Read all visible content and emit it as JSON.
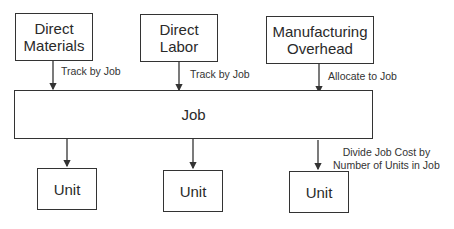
{
  "sources": [
    {
      "label_line1": "Direct",
      "label_line2": "Materials",
      "edge_label": "Track by Job"
    },
    {
      "label_line1": "Direct",
      "label_line2": "Labor",
      "edge_label": "Track by Job"
    },
    {
      "label_line1": "Manufacturing",
      "label_line2": "Overhead",
      "edge_label": "Allocate to Job"
    }
  ],
  "job": {
    "label": "Job"
  },
  "units": [
    {
      "label": "Unit"
    },
    {
      "label": "Unit"
    },
    {
      "label": "Unit"
    }
  ],
  "unit_edge_label": {
    "line1": "Divide Job Cost by",
    "line2": "Number of Units in Job"
  }
}
